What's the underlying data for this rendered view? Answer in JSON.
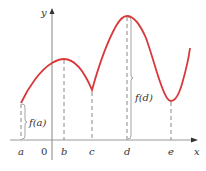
{
  "diagram": {
    "axes": {
      "x_label": "x",
      "y_label": "y",
      "origin_label": "0",
      "color": "#999999"
    },
    "curve": {
      "color": "#d9383a",
      "points": [
        [
          21,
          103
        ],
        [
          30,
          86
        ],
        [
          40,
          73
        ],
        [
          52,
          63
        ],
        [
          64,
          59
        ],
        [
          76,
          63
        ],
        [
          86,
          76
        ],
        [
          92,
          90
        ],
        [
          98,
          74
        ],
        [
          108,
          44
        ],
        [
          118,
          24
        ],
        [
          127,
          16
        ],
        [
          136,
          20
        ],
        [
          146,
          40
        ],
        [
          158,
          78
        ],
        [
          166,
          97
        ],
        [
          171,
          101
        ],
        [
          176,
          98
        ],
        [
          182,
          84
        ],
        [
          190,
          48
        ]
      ]
    },
    "x_ticks": [
      {
        "label": "a",
        "x": 21
      },
      {
        "label": "b",
        "x": 64
      },
      {
        "label": "c",
        "x": 92
      },
      {
        "label": "d",
        "x": 127
      },
      {
        "label": "e",
        "x": 171
      }
    ],
    "brace_labels": {
      "fa": "f(a)",
      "fd": "f(d)"
    },
    "dashed_color": "#888888"
  }
}
